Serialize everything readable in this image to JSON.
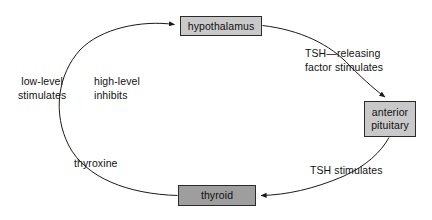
{
  "diagram": {
    "type": "cycle-flow-diagram",
    "canvas": {
      "width": 432,
      "height": 220,
      "background": "#ffffff"
    },
    "nodes": [
      {
        "id": "hypothalamus",
        "label": "hypothalamus",
        "fill": "#c9c9c9",
        "stroke": "#2b2b2b"
      },
      {
        "id": "anterior-pituitary",
        "label": "anterior\npituitary",
        "line1": "anterior",
        "line2": "pituitary",
        "fill": "#c9c9c9",
        "stroke": "#2b2b2b"
      },
      {
        "id": "thyroid",
        "label": "thyroid",
        "fill": "#9e9e9e",
        "stroke": "#2b2b2b"
      }
    ],
    "edges": [
      {
        "id": "hypothalamus-to-pituitary",
        "from": "hypothalamus",
        "to": "anterior-pituitary",
        "line1": "TSH—releasing",
        "line2": "factor stimulates"
      },
      {
        "id": "pituitary-to-thyroid",
        "from": "anterior-pituitary",
        "to": "thyroid",
        "line1": "TSH stimulates"
      },
      {
        "id": "thyroid-to-hypothalamus",
        "from": "thyroid",
        "to": "hypothalamus",
        "line1": "thyroxine"
      }
    ],
    "annotations": [
      {
        "id": "low-level",
        "line1": "low-level",
        "line2": "stimulates"
      },
      {
        "id": "high-level",
        "line1": "high-level",
        "line2": "inhibits"
      }
    ]
  }
}
